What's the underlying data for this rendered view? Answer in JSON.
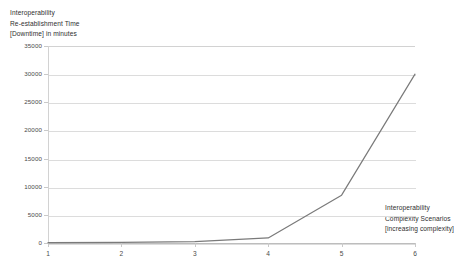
{
  "chart_data": {
    "type": "line",
    "title": "",
    "ylabel": "Interoperability Re-establishment Time [Downtime] in minutes",
    "xlabel": "Interoperability Complexity Scenarios [increasing complexity]",
    "ylabel_lines": [
      "Interoperability",
      "Re-establishment Time",
      "[Downtime] in minutes"
    ],
    "xlabel_lines": [
      "Interoperability",
      "Complexity Scenarios",
      "[increasing complexity]"
    ],
    "categories": [
      "1",
      "2",
      "3",
      "4",
      "5",
      "6"
    ],
    "x": [
      1,
      2,
      3,
      4,
      5,
      6
    ],
    "values": [
      60,
      120,
      240,
      900,
      8500,
      30000
    ],
    "series": [
      {
        "name": "Downtime",
        "values": [
          60,
          120,
          240,
          900,
          8500,
          30000
        ],
        "color": "#7a7a7a"
      }
    ],
    "xlim": [
      1,
      6
    ],
    "ylim": [
      0,
      35000
    ],
    "ytick_labels": [
      "35000",
      "30000",
      "25000",
      "20000",
      "15000",
      "10000",
      "5000",
      "0"
    ],
    "ytick_values": [
      35000,
      30000,
      25000,
      20000,
      15000,
      10000,
      5000,
      0
    ],
    "xtick_labels": [
      "1",
      "2",
      "3",
      "4",
      "5",
      "6"
    ],
    "grid": true,
    "grid_axis": "y",
    "legend": false,
    "legend_position": "none",
    "colors": {
      "line": "#7a7a7a",
      "gridline": "#dcdcdc",
      "axis": "#bdbdbd",
      "text": "#2f2f2f",
      "background": "#ffffff"
    }
  }
}
